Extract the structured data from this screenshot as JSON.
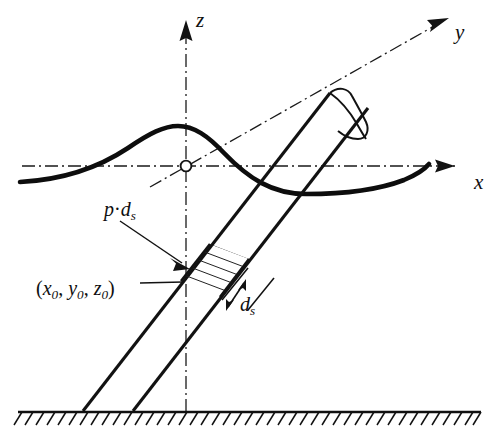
{
  "figure": {
    "background_color": "#ffffff",
    "line_color": "#121212"
  },
  "axes": {
    "z": {
      "label": "z",
      "icon": "arrow-up-icon",
      "style": "dash-dot chain line"
    },
    "y": {
      "label": "y",
      "icon": "arrow-upright-icon",
      "style": "dash-dot chain line"
    },
    "x": {
      "label": "x",
      "icon": "arrow-right-icon",
      "style": "dash-dot chain line"
    },
    "origin": {
      "marker": "open-circle",
      "label": ""
    }
  },
  "annotations": {
    "load": {
      "symbol": "p",
      "operator": "·",
      "differential": "d",
      "differential_sub": "s"
    },
    "point": {
      "open": "(",
      "x": "x",
      "x_sub": "0",
      "sep1": ", ",
      "y": "y",
      "y_sub": "0",
      "sep2": ", ",
      "z": "z",
      "z_sub": "0",
      "close": ")"
    },
    "element": {
      "differential": "d",
      "differential_sub": "s"
    }
  },
  "objects": {
    "rod": "inclined cylindrical rod with rounded top cap",
    "slice": "hatched differential element of length d_s",
    "ground": "hatched fixed ground support line",
    "surface": "thick wavy free-surface curve"
  }
}
